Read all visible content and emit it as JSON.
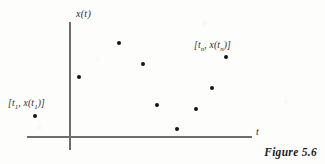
{
  "figure": {
    "caption": "Figure 5.6",
    "background_color": "#fdfdfc",
    "axis_color": "#6d6d6d",
    "point_color": "#151515",
    "text_color": "#2a2a2a"
  },
  "axes": {
    "y_label": "x(t)",
    "x_label": "t",
    "origin": {
      "x": 69,
      "y": 136
    },
    "y_axis": {
      "x": 69,
      "top": 22,
      "bottom": 150
    },
    "x_axis": {
      "y": 136,
      "left": 27,
      "right": 252
    }
  },
  "annotations": [
    {
      "name": "first-sample-label",
      "prefix": "[t",
      "sub1": "1",
      "middle": ", x(t",
      "sub2": "1",
      "suffix": ")]",
      "x": 8,
      "y": 98
    },
    {
      "name": "nth-sample-label",
      "prefix": "[t",
      "sub1": "n",
      "middle": ", x(t",
      "sub2": "n",
      "suffix": ")]",
      "x": 194,
      "y": 40
    }
  ],
  "chart_data": {
    "type": "scatter",
    "title": "Figure 5.6",
    "xlabel": "t",
    "ylabel": "x(t)",
    "grid": false,
    "legend": null,
    "note": "Discrete-time samples of a continuous signal x(t); pixel coordinates measured from the scanned figure, with data values given in axis units relative to the origin at (69,136).",
    "pixel_origin": {
      "x": 69,
      "y": 136
    },
    "points_px": [
      {
        "label": "[t1, x(t1)]",
        "x": 35,
        "y": 116
      },
      {
        "label": "",
        "x": 79,
        "y": 77
      },
      {
        "label": "",
        "x": 119,
        "y": 43
      },
      {
        "label": "",
        "x": 143,
        "y": 64
      },
      {
        "label": "",
        "x": 157,
        "y": 105
      },
      {
        "label": "",
        "x": 177,
        "y": 129
      },
      {
        "label": "",
        "x": 196,
        "y": 109
      },
      {
        "label": "",
        "x": 212,
        "y": 88
      },
      {
        "label": "[tn, x(tn)]",
        "x": 226,
        "y": 57
      }
    ],
    "x": [
      -34,
      10,
      50,
      74,
      88,
      108,
      127,
      143,
      157
    ],
    "y": [
      20,
      59,
      93,
      72,
      31,
      7,
      27,
      48,
      79
    ],
    "xlim": [
      -42,
      183
    ],
    "ylim": [
      -14,
      114
    ],
    "series": [
      {
        "name": "x(t) samples",
        "x": [
          -34,
          10,
          50,
          74,
          88,
          108,
          127,
          143,
          157
        ],
        "values": [
          20,
          59,
          93,
          72,
          31,
          7,
          27,
          48,
          79
        ]
      }
    ]
  }
}
